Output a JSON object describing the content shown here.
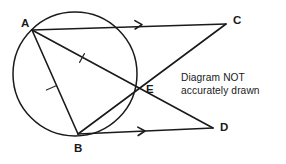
{
  "figure": {
    "width": 286,
    "height": 164,
    "background_color": "#ffffff",
    "stroke_color": "#1a1a1a"
  },
  "note": {
    "line1": "Diagram NOT",
    "line2": "accurately drawn"
  },
  "circle": {
    "name": "circle",
    "cx": 75,
    "cy": 74,
    "r": 62
  },
  "points": [
    {
      "id": "A",
      "label": "A",
      "x": 32,
      "y": 30,
      "label_x": 21,
      "label_y": 27
    },
    {
      "id": "B",
      "label": "B",
      "x": 78,
      "y": 134,
      "label_x": 74,
      "label_y": 152
    },
    {
      "id": "C",
      "label": "C",
      "x": 226,
      "y": 24,
      "label_x": 233,
      "label_y": 24
    },
    {
      "id": "D",
      "label": "D",
      "x": 213,
      "y": 128,
      "label_x": 220,
      "label_y": 131
    },
    {
      "id": "E",
      "label": "E",
      "x": 135,
      "y": 90,
      "label_x": 146,
      "label_y": 93
    }
  ],
  "segments": [
    {
      "id": "AC",
      "from": "A",
      "to": "C",
      "x1": 32,
      "y1": 30,
      "x2": 226,
      "y2": 24,
      "arrow": true
    },
    {
      "id": "BD",
      "from": "B",
      "to": "D",
      "x1": 78,
      "y1": 134,
      "x2": 213,
      "y2": 128,
      "arrow": true
    },
    {
      "id": "AD",
      "from": "A",
      "to": "D",
      "x1": 32,
      "y1": 30,
      "x2": 213,
      "y2": 128,
      "arrow": false
    },
    {
      "id": "CB",
      "from": "C",
      "to": "B",
      "x1": 226,
      "y1": 24,
      "x2": 78,
      "y2": 134,
      "arrow": false
    },
    {
      "id": "AB",
      "from": "A",
      "to": "B",
      "x1": 32,
      "y1": 30,
      "x2": 78,
      "y2": 134,
      "arrow": false
    }
  ],
  "arrow_markers": [
    {
      "id": "arrow-on-AC",
      "on": "AC",
      "x": 142,
      "y": 24.6,
      "angle": -1.8
    },
    {
      "id": "arrow-on-BD",
      "on": "BD",
      "x": 145,
      "y": 131.0,
      "angle": -2.5
    }
  ],
  "tick_marks": [
    {
      "id": "tick-on-AE",
      "on": "AE",
      "x": 82,
      "y": 58,
      "angle": 29
    },
    {
      "id": "tick-on-AB",
      "on": "AB",
      "x": 51,
      "y": 88,
      "angle": 66
    }
  ]
}
